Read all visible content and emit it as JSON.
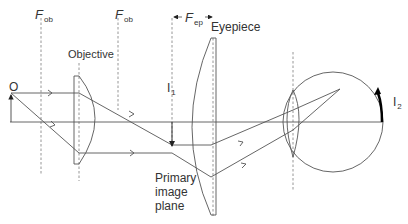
{
  "diagram": {
    "type": "optical ray diagram - compound microscope with eye",
    "labels": {
      "f_ob_left": {
        "symbol": "F",
        "subscript": "ob"
      },
      "f_ob_right": {
        "symbol": "F",
        "subscript": "ob"
      },
      "f_ep": {
        "symbol": "F",
        "subscript": "ep"
      },
      "objective": "Objective",
      "eyepiece": "Eyepiece",
      "object": "O",
      "image1": {
        "symbol": "I",
        "subscript": "1"
      },
      "image2": {
        "symbol": "I",
        "subscript": "2"
      },
      "primary_image_plane": "Primary\nimage\nplane"
    },
    "colors": {
      "line": "#555555",
      "dashed": "#888888",
      "text": "#333333",
      "image_arrow": "#000000"
    }
  }
}
